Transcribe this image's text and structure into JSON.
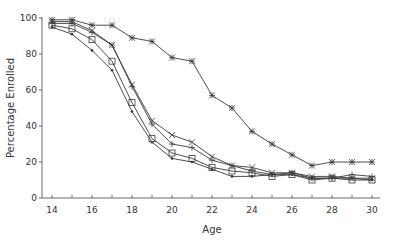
{
  "chart_data": {
    "type": "line",
    "title": "",
    "xlabel": "Age",
    "ylabel": "Percentage Enrolled",
    "xlim": [
      14,
      30
    ],
    "ylim": [
      0,
      100
    ],
    "x_ticks": [
      14,
      16,
      18,
      20,
      22,
      24,
      26,
      28,
      30
    ],
    "x_minor_ticks": [
      15,
      17,
      19,
      21,
      23,
      25,
      27,
      29
    ],
    "y_ticks": [
      0,
      20,
      40,
      60,
      80,
      100
    ],
    "grid": false,
    "legend": null,
    "x": [
      14,
      15,
      16,
      17,
      18,
      19,
      20,
      21,
      22,
      23,
      24,
      25,
      26,
      27,
      28,
      29,
      30
    ],
    "series": [
      {
        "name": "asterisk",
        "marker": "asterisk",
        "values": [
          99,
          99,
          96,
          96,
          89,
          87,
          78,
          76,
          57,
          50,
          37,
          30,
          24,
          18,
          20,
          20,
          20
        ]
      },
      {
        "name": "cross",
        "marker": "x",
        "values": [
          98,
          98,
          93,
          85,
          63,
          43,
          35,
          31,
          23,
          18,
          17,
          14,
          14,
          12,
          12,
          11,
          11
        ]
      },
      {
        "name": "plus",
        "marker": "plus",
        "values": [
          97,
          97,
          92,
          85,
          62,
          41,
          30,
          28,
          21,
          18,
          15,
          13,
          14,
          11,
          11,
          13,
          12
        ]
      },
      {
        "name": "square",
        "marker": "square",
        "values": [
          96,
          94,
          88,
          76,
          53,
          33,
          25,
          22,
          17,
          15,
          14,
          12,
          13,
          10,
          11,
          10,
          10
        ]
      },
      {
        "name": "dot",
        "marker": "dot",
        "values": [
          95,
          91,
          82,
          71,
          48,
          31,
          22,
          20,
          16,
          12,
          12,
          13,
          13,
          11,
          11,
          11,
          10
        ]
      }
    ]
  }
}
